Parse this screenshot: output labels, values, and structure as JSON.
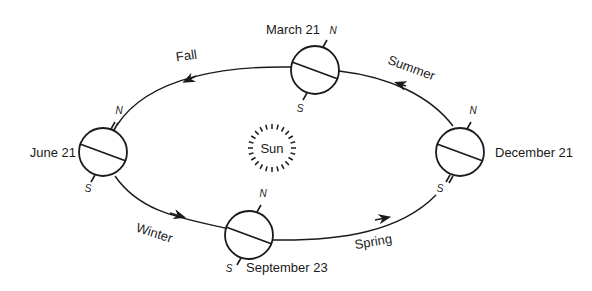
{
  "diagram": {
    "colors": {
      "ink": "#1a1a1a",
      "background": "#ffffff"
    },
    "sun": {
      "label": "Sun"
    },
    "positions": [
      {
        "id": "march",
        "date_label": "March 21",
        "north_label": "N",
        "south_label": "S"
      },
      {
        "id": "june",
        "date_label": "June 21",
        "north_label": "N",
        "south_label": "S"
      },
      {
        "id": "september",
        "date_label": "September 23",
        "north_label": "N",
        "south_label": "S"
      },
      {
        "id": "december",
        "date_label": "December 21",
        "north_label": "N",
        "south_label": "S"
      }
    ],
    "seasons": [
      {
        "id": "fall",
        "label": "Fall"
      },
      {
        "id": "summer",
        "label": "Summer"
      },
      {
        "id": "winter",
        "label": "Winter"
      },
      {
        "id": "spring",
        "label": "Spring"
      }
    ]
  }
}
